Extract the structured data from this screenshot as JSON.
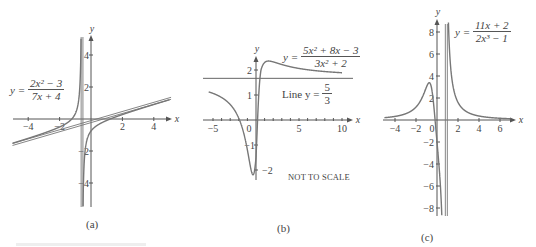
{
  "chart_data": [
    {
      "id": "a",
      "type": "line",
      "caption": "(a)",
      "title": "y = (2x^2 - 3)/(7x + 4)",
      "formula": {
        "lhs": "y =",
        "num": "2x² − 3",
        "den": "7x + 4"
      },
      "xlabel": "x",
      "ylabel": "y",
      "xlim": [
        -5,
        5
      ],
      "ylim": [
        -5.5,
        5.5
      ],
      "xticks": [
        -4,
        -2,
        2,
        4
      ],
      "yticks": [
        4,
        2,
        -2,
        -4
      ],
      "asymptotes": {
        "vertical": -0.5714,
        "oblique": "y = (2/7)x - 8/49"
      },
      "series": [
        {
          "name": "y = (2x^2-3)/(7x+4)",
          "x": [
            -5,
            -4,
            -3,
            -2,
            -1.5,
            -1,
            -0.8,
            -0.7,
            -0.65,
            -0.6,
            -0.5,
            -0.4,
            -0.2,
            0,
            0.5,
            1,
            1.5,
            2,
            3,
            4,
            5
          ],
          "y": [
            -1.52,
            -1.21,
            -0.88,
            -0.5,
            -0.23,
            0.33,
            1.21,
            2.28,
            3.48,
            5.3,
            6.2,
            -2.14,
            -1.13,
            -0.75,
            -0.33,
            -0.09,
            0.1,
            0.28,
            0.6,
            0.91,
            1.21
          ]
        },
        {
          "name": "oblique asymptote",
          "x": [
            -5,
            5
          ],
          "y": [
            -1.59,
            1.27
          ]
        }
      ]
    },
    {
      "id": "b",
      "type": "line",
      "caption": "(b)",
      "title": "y = (5x^2 + 8x - 3)/(3x^2 + 2)",
      "formula": {
        "lhs": "y =",
        "num": "5x² + 8x − 3",
        "den": "3x² + 2"
      },
      "line_label": {
        "prefix": "Line y =",
        "num": "5",
        "den": "3"
      },
      "note": "NOT TO SCALE",
      "xlabel": "x",
      "ylabel": "y",
      "xlim": [
        -5.5,
        11
      ],
      "ylim": [
        -2.3,
        2.7
      ],
      "xticks": [
        -5,
        0,
        5,
        10
      ],
      "yticks": [
        2,
        1,
        -1,
        -2
      ],
      "asymptotes": {
        "horizontal": 1.6667
      },
      "series": [
        {
          "name": "y = (5x^2+8x-3)/(3x^2+2)",
          "x": [
            -5.5,
            -4,
            -3,
            -2,
            -1.5,
            -1,
            -0.5,
            -0.3,
            0,
            0.3,
            0.5,
            1,
            2,
            3,
            5,
            8,
            11
          ],
          "y": [
            1.2,
            1.02,
            0.83,
            0.36,
            -0.17,
            -0.8,
            -1.93,
            -2.2,
            -1.5,
            0.1,
            0.82,
            2.0,
            2.36,
            2.28,
            2.06,
            1.89,
            1.82
          ]
        },
        {
          "name": "Line y = 5/3",
          "x": [
            -5.5,
            11
          ],
          "y": [
            1.6667,
            1.6667
          ]
        }
      ]
    },
    {
      "id": "c",
      "type": "line",
      "caption": "(c)",
      "title": "y = (11x + 2)/(2x^3 - 1)",
      "formula": {
        "lhs": "y =",
        "num": "11x + 2",
        "den": "2x³ − 1"
      },
      "xlabel": "x",
      "ylabel": "y",
      "xlim": [
        -5,
        7
      ],
      "ylim": [
        -8.5,
        9
      ],
      "xticks": [
        -4,
        -2,
        0,
        2,
        4,
        6
      ],
      "yticks": [
        8,
        6,
        4,
        2,
        -2,
        -4,
        -6,
        -8
      ],
      "asymptotes": {
        "vertical": 0.7937
      },
      "series": [
        {
          "name": "y = (11x+2)/(2x^3-1)",
          "x": [
            -5,
            -4,
            -3,
            -2,
            -1.5,
            -1,
            -0.7,
            -0.5,
            -0.3,
            -0.18,
            0,
            0.3,
            0.5,
            0.7,
            0.85,
            1,
            1.5,
            2,
            3,
            4,
            6,
            7
          ],
          "y": [
            0.21,
            0.33,
            0.56,
            1.18,
            1.86,
            3.0,
            3.34,
            2.8,
            1.23,
            0.0,
            -2.0,
            -5.5,
            -10,
            -30,
            40,
            13,
            3.3,
            1.6,
            0.66,
            0.36,
            0.16,
            0.11
          ]
        }
      ]
    }
  ],
  "labels": {
    "x": "x",
    "y": "y"
  }
}
